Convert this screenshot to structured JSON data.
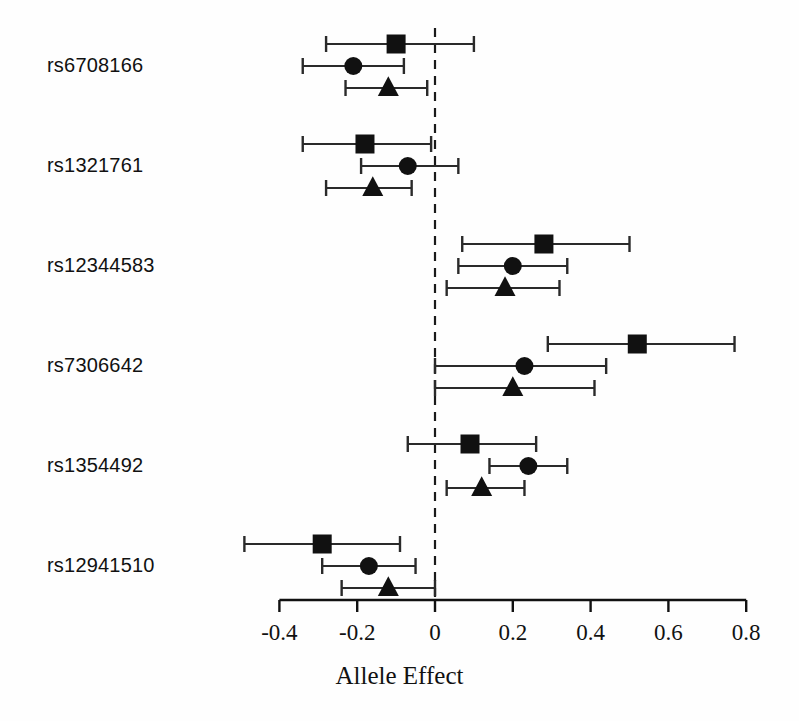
{
  "chart_data": {
    "type": "scatter",
    "title": "",
    "xlabel": "Allele Effect",
    "ylabel": "",
    "xlim": [
      -0.5,
      0.85
    ],
    "grid": false,
    "legend": "none",
    "reference_line": 0,
    "axis_ticks": [
      {
        "value": -0.4,
        "label": "-0.4"
      },
      {
        "value": -0.2,
        "label": "-0.2"
      },
      {
        "value": 0,
        "label": "0"
      },
      {
        "value": 0.2,
        "label": "0.2"
      },
      {
        "value": 0.4,
        "label": "0.4"
      },
      {
        "value": 0.6,
        "label": "0.6"
      },
      {
        "value": 0.8,
        "label": "0.8"
      }
    ],
    "series": [
      {
        "name": "square",
        "marker": "square"
      },
      {
        "name": "circle",
        "marker": "circle"
      },
      {
        "name": "triangle",
        "marker": "triangle"
      }
    ],
    "categories": [
      "rs6708166",
      "rs1321761",
      "rs12344583",
      "rs7306642",
      "rs1354492",
      "rs12941510"
    ],
    "groups": [
      {
        "label": "rs6708166",
        "points": [
          {
            "marker": "square",
            "estimate": -0.1,
            "ci_low": -0.28,
            "ci_high": 0.1
          },
          {
            "marker": "circle",
            "estimate": -0.21,
            "ci_low": -0.34,
            "ci_high": -0.08
          },
          {
            "marker": "triangle",
            "estimate": -0.12,
            "ci_low": -0.23,
            "ci_high": -0.02
          }
        ]
      },
      {
        "label": "rs1321761",
        "points": [
          {
            "marker": "square",
            "estimate": -0.18,
            "ci_low": -0.34,
            "ci_high": -0.01
          },
          {
            "marker": "circle",
            "estimate": -0.07,
            "ci_low": -0.19,
            "ci_high": 0.06
          },
          {
            "marker": "triangle",
            "estimate": -0.16,
            "ci_low": -0.28,
            "ci_high": -0.06
          }
        ]
      },
      {
        "label": "rs12344583",
        "points": [
          {
            "marker": "square",
            "estimate": 0.28,
            "ci_low": 0.07,
            "ci_high": 0.5
          },
          {
            "marker": "circle",
            "estimate": 0.2,
            "ci_low": 0.06,
            "ci_high": 0.34
          },
          {
            "marker": "triangle",
            "estimate": 0.18,
            "ci_low": 0.03,
            "ci_high": 0.32
          }
        ]
      },
      {
        "label": "rs7306642",
        "points": [
          {
            "marker": "square",
            "estimate": 0.52,
            "ci_low": 0.29,
            "ci_high": 0.77
          },
          {
            "marker": "circle",
            "estimate": 0.23,
            "ci_low": 0.0,
            "ci_high": 0.44
          },
          {
            "marker": "triangle",
            "estimate": 0.2,
            "ci_low": 0.0,
            "ci_high": 0.41
          }
        ]
      },
      {
        "label": "rs1354492",
        "points": [
          {
            "marker": "square",
            "estimate": 0.09,
            "ci_low": -0.07,
            "ci_high": 0.26
          },
          {
            "marker": "circle",
            "estimate": 0.24,
            "ci_low": 0.14,
            "ci_high": 0.34
          },
          {
            "marker": "triangle",
            "estimate": 0.12,
            "ci_low": 0.03,
            "ci_high": 0.23
          }
        ]
      },
      {
        "label": "rs12941510",
        "points": [
          {
            "marker": "square",
            "estimate": -0.29,
            "ci_low": -0.49,
            "ci_high": -0.09
          },
          {
            "marker": "circle",
            "estimate": -0.17,
            "ci_low": -0.29,
            "ci_high": -0.05
          },
          {
            "marker": "triangle",
            "estimate": -0.12,
            "ci_low": -0.24,
            "ci_high": 0.0
          }
        ]
      }
    ],
    "style": {
      "marker_color": "#111111",
      "line_color": "#2a2a2a",
      "axis_color": "#111111",
      "reference_line_color": "#1a1a1a",
      "background": "#ffffff"
    }
  }
}
